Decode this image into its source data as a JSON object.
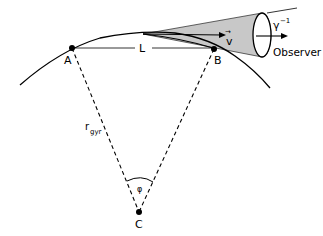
{
  "diagram": {
    "labels": {
      "point_a": "A",
      "point_b": "B",
      "point_c": "C",
      "arc_length": "L",
      "radius_main": "r",
      "radius_sub": "gyr",
      "angle": "φ",
      "velocity": "v",
      "velocity_arrow": "→",
      "gamma_base": "γ",
      "gamma_exp": "−1",
      "observer": "Observer"
    },
    "colors": {
      "cone_fill": "#c8c8c8",
      "stroke": "#000000",
      "background": "#ffffff"
    }
  }
}
